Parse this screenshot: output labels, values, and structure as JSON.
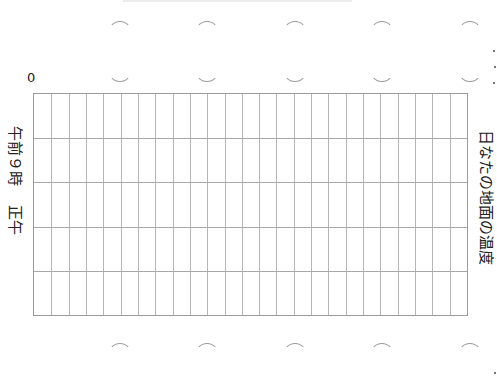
{
  "worksheet": {
    "title": "日なたの地面の温度",
    "axis": {
      "y_origin_label": "0",
      "x_labels": [
        "午前９時",
        "正午"
      ]
    },
    "grid": {
      "columns": 25,
      "rows": 5,
      "line_color": "#b5b5b5",
      "border_color": "#9a9a9a"
    },
    "binder_arcs": {
      "count": 5,
      "color": "#9a9a9a"
    }
  }
}
